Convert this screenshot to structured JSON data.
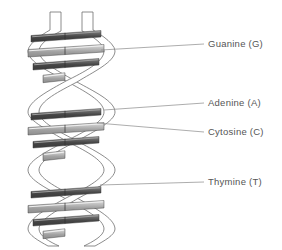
{
  "diagram": {
    "type": "dna-double-helix",
    "background_color": "#ffffff",
    "strand_outline_color": "#6f6f6f",
    "strand_fill_color": "#ffffff",
    "leader_line_color": "#8a8a8a",
    "label_text_color": "#555555",
    "rung_dark_color": "#4a4a4a",
    "rung_light_color": "#a8a8a8",
    "rung_highlight_color": "#d8d8d8"
  },
  "labels": [
    {
      "id": "guanine",
      "text": "Guanine (G)",
      "leader": {
        "x1": 101,
        "y1": 50,
        "x2": 204,
        "y2": 44
      },
      "text_x": 208,
      "text_y": 39
    },
    {
      "id": "adenine",
      "text": "Adenine (A)",
      "leader": {
        "x1": 104,
        "y1": 110,
        "x2": 204,
        "y2": 103
      },
      "text_x": 208,
      "text_y": 98
    },
    {
      "id": "cytosine",
      "text": "Cytosine (C)",
      "leader": {
        "x1": 97,
        "y1": 123,
        "x2": 204,
        "y2": 132
      },
      "text_x": 208,
      "text_y": 127
    },
    {
      "id": "thymine",
      "text": "Thymine (T)",
      "leader": {
        "x1": 100,
        "y1": 185,
        "x2": 204,
        "y2": 182
      },
      "text_x": 208,
      "text_y": 177
    }
  ],
  "helix": {
    "turns": 3,
    "center_x": 66,
    "top_y": 12,
    "bottom_y": 246,
    "amplitude": 38,
    "ribbon_width": 11,
    "period": 78
  },
  "rungs": [
    {
      "y": 33,
      "half_width": 35,
      "shade": "dark",
      "full": true
    },
    {
      "y": 47,
      "half_width": 38,
      "shade": "light",
      "full": true
    },
    {
      "y": 61,
      "half_width": 33,
      "shade": "dark",
      "full": true
    },
    {
      "y": 74,
      "half_width": 11,
      "shade": "light",
      "full": false
    },
    {
      "y": 111,
      "half_width": 35,
      "shade": "dark",
      "full": true
    },
    {
      "y": 125,
      "half_width": 38,
      "shade": "light",
      "full": true
    },
    {
      "y": 139,
      "half_width": 33,
      "shade": "dark",
      "full": true
    },
    {
      "y": 152,
      "half_width": 11,
      "shade": "light",
      "full": false
    },
    {
      "y": 189,
      "half_width": 35,
      "shade": "dark",
      "full": true
    },
    {
      "y": 203,
      "half_width": 38,
      "shade": "light",
      "full": true
    },
    {
      "y": 217,
      "half_width": 33,
      "shade": "dark",
      "full": true
    },
    {
      "y": 230,
      "half_width": 11,
      "shade": "light",
      "full": false
    }
  ]
}
